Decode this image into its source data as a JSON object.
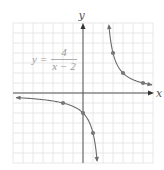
{
  "chart_data": {
    "type": "line",
    "title": "",
    "equation": {
      "lhs": "y =",
      "numerator": "4",
      "denominator": "x − 2"
    },
    "xlabel": "x",
    "ylabel": "y",
    "xlim": [
      -7,
      7
    ],
    "ylim": [
      -7,
      7
    ],
    "grid": true,
    "grid_step": 1,
    "asymptotes": {
      "vertical": 2,
      "horizontal": 0
    },
    "series": [
      {
        "name": "left branch",
        "points": [
          [
            -6.7,
            -0.46
          ],
          [
            -2,
            -1
          ],
          [
            0,
            -2
          ],
          [
            1,
            -4
          ],
          [
            1.4,
            -6.7
          ]
        ],
        "marked_points": [
          [
            -2,
            -1
          ],
          [
            0,
            -2
          ],
          [
            1,
            -4
          ]
        ]
      },
      {
        "name": "right branch",
        "points": [
          [
            2.6,
            6.7
          ],
          [
            3,
            4
          ],
          [
            4,
            2
          ],
          [
            6,
            1
          ],
          [
            6.9,
            0.82
          ]
        ],
        "marked_points": [
          [
            3,
            4
          ],
          [
            4,
            2
          ],
          [
            6,
            1
          ]
        ]
      }
    ],
    "colors": {
      "curve": "#6b6b6b",
      "axes": "#555555",
      "grid": "#e2e2e2",
      "points": "#777777",
      "formula": "#9a9a9a"
    }
  }
}
